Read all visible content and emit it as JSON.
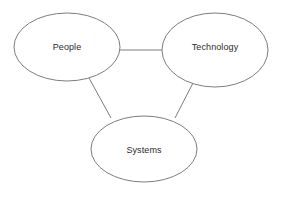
{
  "diagram": {
    "title": "People Technology Systems",
    "type": "venn-triad",
    "background_color": "#ffffff",
    "stroke_color": "#7d7d7d",
    "text_color": "#2b2b2b",
    "nodes": [
      {
        "id": "people",
        "label": "People",
        "cx": 67,
        "cy": 47,
        "rx": 53,
        "ry": 34
      },
      {
        "id": "technology",
        "label": "Technology",
        "cx": 215,
        "cy": 50,
        "rx": 53,
        "ry": 37
      },
      {
        "id": "systems",
        "label": "Systems",
        "cx": 144,
        "cy": 149,
        "rx": 53,
        "ry": 33
      }
    ],
    "connectors": [
      {
        "id": "people-technology",
        "from": "people",
        "to": "technology",
        "x1": 119,
        "y1": 50,
        "x2": 163,
        "y2": 50
      },
      {
        "id": "people-systems",
        "from": "people",
        "to": "systems",
        "x1": 89,
        "y1": 78,
        "x2": 111,
        "y2": 118
      },
      {
        "id": "technology-systems",
        "from": "technology",
        "to": "systems",
        "x1": 193,
        "y1": 83,
        "x2": 175,
        "y2": 118
      }
    ]
  }
}
